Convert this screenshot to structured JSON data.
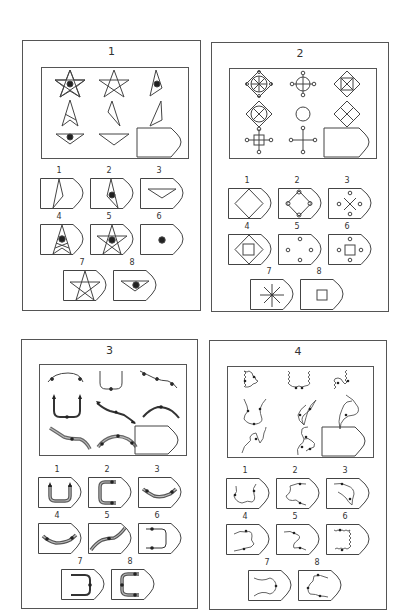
{
  "puzzles": [
    {
      "title": "1",
      "matrix": {
        "cells": [
          "star-with-dot",
          "star",
          "narrow-kite-with-dot",
          "star-bottom-kite",
          "thin-triangle",
          "thin-triangle-mirror",
          "inverted-triangle-with-dot",
          "inverted-triangle",
          "blank-answer"
        ]
      },
      "options": [
        {
          "label": "1",
          "figure": "thin-triangle-large"
        },
        {
          "label": "2",
          "figure": "narrow-kite-with-dot"
        },
        {
          "label": "3",
          "figure": "inverted-triangle"
        },
        {
          "label": "4",
          "figure": "star-bottom-kite-with-dot"
        },
        {
          "label": "5",
          "figure": "star-with-dot"
        },
        {
          "label": "6",
          "figure": "dot"
        },
        {
          "label": "7",
          "figure": "star"
        },
        {
          "label": "8",
          "figure": "inverted-triangle-with-dot"
        }
      ]
    },
    {
      "title": "2",
      "matrix": {
        "cells": [
          "diamond-circle-cross-nodes",
          "circle-cross-nodes",
          "diamond-square-x",
          "diamond-circle-x",
          "circle",
          "diamond-quartered",
          "square-cross-nodes",
          "cross-nodes",
          "blank-answer"
        ]
      },
      "options": [
        {
          "label": "1",
          "figure": "diamond"
        },
        {
          "label": "2",
          "figure": "diamond-corner-nodes"
        },
        {
          "label": "3",
          "figure": "x-nodes"
        },
        {
          "label": "4",
          "figure": "diamond-square"
        },
        {
          "label": "5",
          "figure": "four-nodes"
        },
        {
          "label": "6",
          "figure": "square-four-nodes"
        },
        {
          "label": "7",
          "figure": "asterisk"
        },
        {
          "label": "8",
          "figure": "square"
        }
      ]
    },
    {
      "title": "3",
      "matrix": {
        "cells": [
          "arch-thin",
          "u-thin",
          "wave-thin",
          "u-bold",
          "wave-bold",
          "arch-bold",
          "wave-double",
          "arch-double",
          "blank-answer"
        ]
      },
      "options": [
        {
          "label": "1",
          "figure": "u-double"
        },
        {
          "label": "2",
          "figure": "c-double"
        },
        {
          "label": "3",
          "figure": "bowl-double"
        },
        {
          "label": "4",
          "figure": "bowl-double-wide"
        },
        {
          "label": "5",
          "figure": "wave-double"
        },
        {
          "label": "6",
          "figure": "bracket-thin"
        },
        {
          "label": "7",
          "figure": "bracket-bold"
        },
        {
          "label": "8",
          "figure": "c-double-alt"
        }
      ]
    },
    {
      "title": "4",
      "matrix": {
        "cells": [
          "squiggle-triangle",
          "squiggle-u",
          "squiggle-n",
          "curve-vase",
          "curve-claw",
          "curve-hook",
          "curve-z",
          "curve-knot",
          "blank-answer"
        ]
      },
      "options": [
        {
          "label": "1",
          "figure": "curve-cup"
        },
        {
          "label": "2",
          "figure": "curve-blob"
        },
        {
          "label": "3",
          "figure": "curve-tri"
        },
        {
          "label": "4",
          "figure": "curve-bracket"
        },
        {
          "label": "5",
          "figure": "curve-s"
        },
        {
          "label": "6",
          "figure": "squiggle-bracket"
        },
        {
          "label": "7",
          "figure": "curve-bowtie"
        },
        {
          "label": "8",
          "figure": "curve-c"
        }
      ]
    }
  ],
  "colors": {
    "stroke": "#444444",
    "fill_dot": "#222222",
    "double_line": "#888888"
  }
}
